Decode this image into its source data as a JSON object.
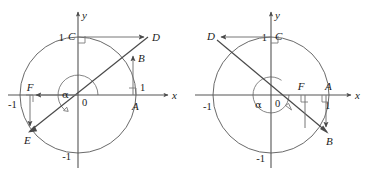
{
  "figure": {
    "background_color": "#ffffff",
    "line_color": "#555555",
    "label_color": "#1b1b1b",
    "panel_count": 2
  },
  "panels": [
    {
      "id": "left",
      "name": "acute-reflex-angle-diagram",
      "description": "Angle alpha terminal side in third quadrant direction, ray through E, with B on tangent at A and D on tangent at C",
      "axes": {
        "x_label": "x",
        "y_label": "y",
        "origin_label": "0"
      },
      "ticks": [
        {
          "name": "y-positive-one",
          "text": "1"
        },
        {
          "name": "x-positive-one",
          "text": "1"
        },
        {
          "name": "x-negative-one",
          "text": "-1"
        },
        {
          "name": "y-negative-one",
          "text": "-1"
        }
      ],
      "points": [
        {
          "name": "point-A",
          "label": "A",
          "note": "on x-axis at x = 1"
        },
        {
          "name": "point-B",
          "label": "B",
          "note": "on vertical tangent line at A, above x-axis"
        },
        {
          "name": "point-C",
          "label": "C",
          "note": "on y-axis at y = 1"
        },
        {
          "name": "point-D",
          "label": "D",
          "note": "on horizontal tangent line at C, right of y-axis"
        },
        {
          "name": "point-E",
          "label": "E",
          "note": "on circle in third quadrant, end of terminal ray"
        },
        {
          "name": "point-F",
          "label": "F",
          "note": "on x-axis, foot of perpendicular from E"
        }
      ],
      "angle": {
        "name": "angle-alpha",
        "symbol": "α"
      }
    },
    {
      "id": "right",
      "name": "reflex-angle-diagram",
      "description": "Angle alpha terminal side in fourth quadrant direction, ray through B, with D on tangent at C and F foot of perpendicular",
      "axes": {
        "x_label": "x",
        "y_label": "y",
        "origin_label": "0"
      },
      "ticks": [
        {
          "name": "y-positive-one",
          "text": "1"
        },
        {
          "name": "x-positive-one",
          "text": "1"
        },
        {
          "name": "x-negative-one",
          "text": "-1"
        },
        {
          "name": "y-negative-one",
          "text": "-1"
        }
      ],
      "points": [
        {
          "name": "point-A",
          "label": "A",
          "note": "on x-axis at x = 1"
        },
        {
          "name": "point-B",
          "label": "B",
          "note": "on vertical tangent line at A, below x-axis"
        },
        {
          "name": "point-C",
          "label": "C",
          "note": "on y-axis at y = 1"
        },
        {
          "name": "point-D",
          "label": "D",
          "note": "on horizontal tangent line at C, left of y-axis"
        },
        {
          "name": "point-F",
          "label": "F",
          "note": "on x-axis, foot of perpendicular from point on circle"
        }
      ],
      "angle": {
        "name": "angle-alpha",
        "symbol": "α"
      }
    }
  ]
}
